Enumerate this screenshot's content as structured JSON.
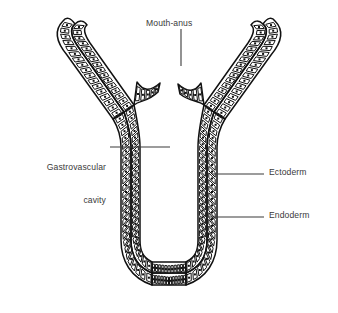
{
  "figure": {
    "background_color": "#ffffff",
    "ink_color": "#111111",
    "label_color": "#3a3a3a",
    "cell_fill": "#ffffff",
    "nucleus_color": "#111111"
  },
  "labels": {
    "mouth_anus": "Mouth-anus",
    "gastrovascular_line1": "Gastrovascular",
    "gastrovascular_line2": "cavity",
    "ectoderm": "Ectoderm",
    "endoderm": "Endoderm"
  },
  "anatomy": {
    "layers": [
      {
        "name": "Ectoderm",
        "position": "outer",
        "description": "outer epithelial cell layer"
      },
      {
        "name": "Endoderm",
        "position": "inner",
        "description": "inner gastrodermis cell layer lining the cavity"
      }
    ],
    "openings": [
      {
        "name": "Mouth-anus",
        "position": "top-center",
        "description": "single opening serving as both mouth and anus"
      }
    ],
    "cavities": [
      {
        "name": "Gastrovascular cavity",
        "description": "blind sac interior enclosed by the endoderm"
      }
    ],
    "cell_count_approx": 230,
    "body_shape": "U-shaped sac with two upward-splaying arms"
  },
  "leader_lines": [
    {
      "name": "mouth-anus-leader",
      "orientation": "vertical",
      "from": [
        181,
        29
      ],
      "to": [
        181,
        66
      ]
    },
    {
      "name": "gastrovascular-leader",
      "orientation": "horizontal",
      "from": [
        110,
        147
      ],
      "to": [
        170,
        147
      ]
    },
    {
      "name": "ectoderm-leader",
      "orientation": "horizontal",
      "from": [
        212,
        174
      ],
      "to": [
        264,
        174
      ]
    },
    {
      "name": "endoderm-leader",
      "orientation": "horizontal",
      "from": [
        207,
        217
      ],
      "to": [
        264,
        217
      ]
    }
  ]
}
